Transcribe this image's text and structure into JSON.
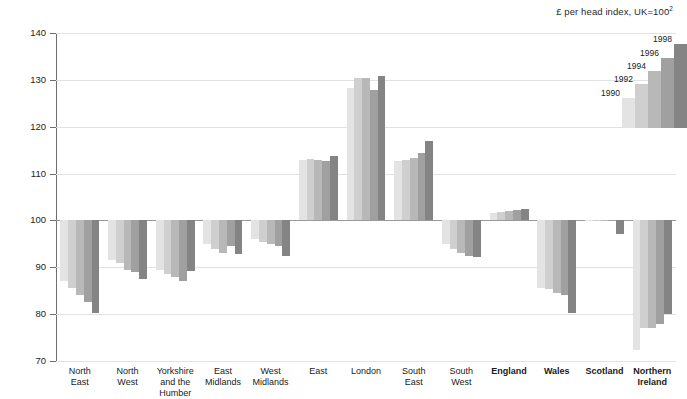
{
  "chart_data": {
    "type": "bar",
    "title": "£ per head index, UK=100",
    "title_footnote": "2",
    "xlabel": "",
    "ylabel": "",
    "ylim": [
      70,
      140
    ],
    "ytick_step": 10,
    "yticks": [
      "70",
      "80",
      "90",
      "100",
      "110",
      "120",
      "130",
      "140"
    ],
    "baseline": 100,
    "grid": true,
    "legend_position": "top-right",
    "categories": [
      "North East",
      "North West",
      "Yorkshire and the Humber",
      "East Midlands",
      "West Midlands",
      "East",
      "London",
      "South East",
      "South West",
      "England",
      "Wales",
      "Scotland",
      "Northern Ireland"
    ],
    "category_lines": [
      [
        "North",
        "East"
      ],
      [
        "North",
        "West"
      ],
      [
        "Yorkshire",
        "and the",
        "Humber"
      ],
      [
        "East",
        "Midlands"
      ],
      [
        "West",
        "Midlands"
      ],
      [
        "East"
      ],
      [
        "London"
      ],
      [
        "South",
        "East"
      ],
      [
        "South",
        "West"
      ],
      [
        "England"
      ],
      [
        "Wales"
      ],
      [
        "Scotland"
      ],
      [
        "Northern",
        "Ireland"
      ]
    ],
    "category_bold": [
      false,
      false,
      false,
      false,
      false,
      false,
      false,
      false,
      false,
      true,
      true,
      true,
      true
    ],
    "series": [
      {
        "name": "1990",
        "color": "#e3e3e3",
        "values": [
          87.0,
          91.5,
          89.5,
          95.0,
          96.0,
          113.0,
          128.2,
          112.7,
          95.0,
          101.5,
          85.5,
          99.8,
          72.3
        ]
      },
      {
        "name": "1992",
        "color": "#cfcfcf",
        "values": [
          85.5,
          91.0,
          88.5,
          94.0,
          95.3,
          113.1,
          130.3,
          112.8,
          94.0,
          101.7,
          85.3,
          99.9,
          77.0
        ]
      },
      {
        "name": "1994",
        "color": "#b8b8b8",
        "values": [
          84.0,
          89.5,
          88.0,
          93.0,
          95.0,
          112.9,
          130.5,
          113.4,
          93.0,
          102.1,
          84.5,
          100.0,
          77.0
        ]
      },
      {
        "name": "1996",
        "color": "#a0a0a0",
        "values": [
          82.5,
          89.0,
          87.0,
          94.6,
          94.5,
          112.7,
          127.8,
          114.4,
          92.5,
          102.2,
          84.0,
          99.9,
          77.8
        ]
      },
      {
        "name": "1998",
        "color": "#848484",
        "values": [
          80.2,
          87.5,
          89.2,
          92.8,
          92.5,
          113.8,
          130.8,
          117.0,
          92.3,
          102.4,
          80.2,
          97.2,
          80.0
        ]
      }
    ]
  },
  "legend": {
    "items": [
      {
        "label": "1990",
        "color": "#e3e3e3"
      },
      {
        "label": "1992",
        "color": "#cfcfcf"
      },
      {
        "label": "1994",
        "color": "#b8b8b8"
      },
      {
        "label": "1996",
        "color": "#a0a0a0"
      },
      {
        "label": "1998",
        "color": "#848484"
      }
    ]
  },
  "axis": {
    "y_tick_labels": [
      "140",
      "130",
      "120",
      "110",
      "100",
      "90",
      "80",
      "70"
    ]
  }
}
